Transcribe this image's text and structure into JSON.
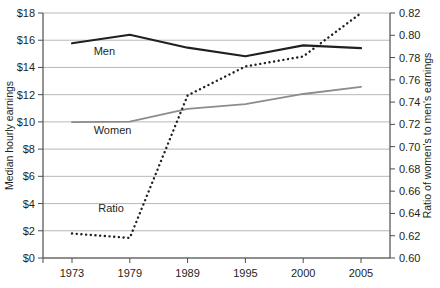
{
  "chart_data": {
    "type": "line",
    "title": "",
    "xlabel": "",
    "categories": [
      "1973",
      "1979",
      "1989",
      "1995",
      "2000",
      "2005"
    ],
    "x": [
      1973,
      1979,
      1989,
      1995,
      2000,
      2005
    ],
    "grid": true,
    "legend": "inline-labels",
    "axes": {
      "left": {
        "label": "Median hourly earnings",
        "ylim": [
          0,
          18
        ],
        "tick_step": 2,
        "ticks": [
          "$0",
          "$2",
          "$4",
          "$6",
          "$8",
          "$10",
          "$12",
          "$14",
          "$16",
          "$18"
        ],
        "tick_values": [
          0,
          2,
          4,
          6,
          8,
          10,
          12,
          14,
          16,
          18
        ]
      },
      "right": {
        "label": "Ratio of women's to men's earnings",
        "ylim": [
          0.6,
          0.82
        ],
        "tick_step": 0.02,
        "ticks": [
          "0.60",
          "0.62",
          "0.64",
          "0.66",
          "0.68",
          "0.70",
          "0.72",
          "0.74",
          "0.76",
          "0.78",
          "0.80",
          "0.82"
        ],
        "tick_values": [
          0.6,
          0.62,
          0.64,
          0.66,
          0.68,
          0.7,
          0.72,
          0.74,
          0.76,
          0.78,
          0.8,
          0.82
        ]
      }
    },
    "series": [
      {
        "name": "Men",
        "label": "Men",
        "axis": "left",
        "color": "#231f20",
        "style": "solid",
        "width": 2.2,
        "values": [
          15.78,
          16.4,
          15.45,
          14.82,
          15.62,
          15.42
        ]
      },
      {
        "name": "Women",
        "label": "Women",
        "axis": "left",
        "color": "#8c8c8c",
        "style": "solid",
        "width": 1.8,
        "values": [
          9.98,
          10.02,
          10.95,
          11.3,
          12.05,
          12.58
        ]
      },
      {
        "name": "Ratio",
        "label": "Ratio",
        "axis": "right",
        "color": "#231f20",
        "style": "dotted",
        "width": 2.0,
        "values": [
          0.622,
          0.618,
          0.746,
          0.772,
          0.781,
          0.82
        ]
      }
    ],
    "annotations": [
      {
        "text": "Men",
        "series": "Men",
        "x": 1975.4,
        "y_left": 14.9
      },
      {
        "text": "Women",
        "series": "Women",
        "x": 1975.4,
        "y_left": 9.1
      },
      {
        "text": "Ratio",
        "series": "Ratio",
        "x": 1975.9,
        "y_left": 3.4
      }
    ],
    "colors": {
      "men": "#231f20",
      "women": "#8c8c8c",
      "ratio": "#231f20",
      "grid": "#a6a6a6",
      "axis": "#4d4d4d"
    }
  }
}
